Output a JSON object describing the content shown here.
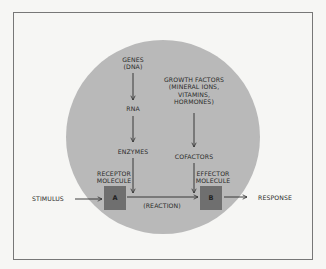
{
  "diagram": {
    "colors": {
      "background": "#f6f6f4",
      "circle": "#b9b9b9",
      "box": "#6f6f6f",
      "line": "#2a2a2a",
      "frame": "#777777"
    },
    "nodes": {
      "genes": "GENES",
      "genes_sub": "(DNA)",
      "rna": "RNA",
      "enzymes": "ENZYMES",
      "growth_factors": "GROWTH FACTORS",
      "growth_factors_sub1": "(MINERAL IONS,",
      "growth_factors_sub2": "VITAMINS,",
      "growth_factors_sub3": "HORMONES)",
      "cofactors": "COFACTORS",
      "receptor_1": "RECEPTOR",
      "receptor_2": "MOLECULE",
      "effector_1": "EFFECTOR",
      "effector_2": "MOLECULE",
      "box_a": "A",
      "box_b": "B",
      "stimulus": "STIMULUS",
      "reaction": "(REACTION)",
      "response": "RESPONSE"
    },
    "edges": [
      {
        "from": "GENES (DNA)",
        "to": "RNA"
      },
      {
        "from": "RNA",
        "to": "ENZYMES"
      },
      {
        "from": "ENZYMES",
        "to": "A"
      },
      {
        "from": "GROWTH FACTORS",
        "to": "COFACTORS"
      },
      {
        "from": "COFACTORS",
        "to": "B"
      },
      {
        "from": "STIMULUS",
        "to": "A"
      },
      {
        "from": "A",
        "to": "B",
        "label": "(REACTION)"
      },
      {
        "from": "B",
        "to": "RESPONSE"
      }
    ]
  }
}
